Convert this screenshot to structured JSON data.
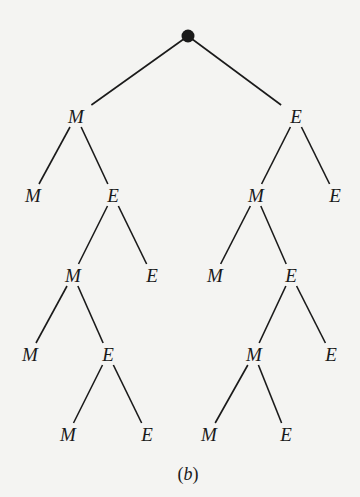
{
  "diagram": {
    "type": "tree",
    "caption": "(b)",
    "caption_letter": "b",
    "colors": {
      "background": "#f4f4f2",
      "ink": "#1a1a1a"
    },
    "root": {
      "id": "root",
      "x": 188,
      "y": 36,
      "marker": "filled-circle"
    },
    "nodes": [
      {
        "id": "n1",
        "label": "M",
        "x": 76,
        "y": 116
      },
      {
        "id": "n2",
        "label": "E",
        "x": 296,
        "y": 116
      },
      {
        "id": "n3",
        "label": "M",
        "x": 33,
        "y": 195
      },
      {
        "id": "n4",
        "label": "E",
        "x": 113,
        "y": 195
      },
      {
        "id": "n5",
        "label": "M",
        "x": 256,
        "y": 195
      },
      {
        "id": "n6",
        "label": "E",
        "x": 335,
        "y": 195
      },
      {
        "id": "n7",
        "label": "M",
        "x": 73,
        "y": 275
      },
      {
        "id": "n8",
        "label": "E",
        "x": 152,
        "y": 275
      },
      {
        "id": "n9",
        "label": "M",
        "x": 215,
        "y": 275
      },
      {
        "id": "n10",
        "label": "E",
        "x": 291,
        "y": 275
      },
      {
        "id": "n11",
        "label": "M",
        "x": 30,
        "y": 354
      },
      {
        "id": "n12",
        "label": "E",
        "x": 108,
        "y": 354
      },
      {
        "id": "n13",
        "label": "M",
        "x": 254,
        "y": 354
      },
      {
        "id": "n14",
        "label": "E",
        "x": 331,
        "y": 354
      },
      {
        "id": "n15",
        "label": "M",
        "x": 68,
        "y": 434
      },
      {
        "id": "n16",
        "label": "E",
        "x": 147,
        "y": 434
      },
      {
        "id": "n17",
        "label": "M",
        "x": 209,
        "y": 434
      },
      {
        "id": "n18",
        "label": "E",
        "x": 286,
        "y": 434
      }
    ],
    "edges": [
      [
        "root",
        "n1"
      ],
      [
        "root",
        "n2"
      ],
      [
        "n1",
        "n3"
      ],
      [
        "n1",
        "n4"
      ],
      [
        "n2",
        "n5"
      ],
      [
        "n2",
        "n6"
      ],
      [
        "n4",
        "n7"
      ],
      [
        "n4",
        "n8"
      ],
      [
        "n5",
        "n9"
      ],
      [
        "n5",
        "n10"
      ],
      [
        "n7",
        "n11"
      ],
      [
        "n7",
        "n12"
      ],
      [
        "n10",
        "n13"
      ],
      [
        "n10",
        "n14"
      ],
      [
        "n12",
        "n15"
      ],
      [
        "n12",
        "n16"
      ],
      [
        "n13",
        "n17"
      ],
      [
        "n13",
        "n18"
      ]
    ]
  }
}
